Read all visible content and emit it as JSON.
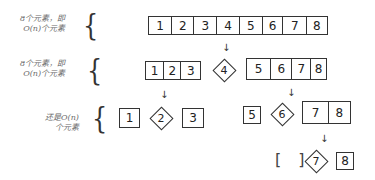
{
  "levels": [
    {
      "label_line1": "8个元素，即",
      "label_line2": "O(n)个元素",
      "groups": [
        {
          "type": "array",
          "values": [
            "1",
            "2",
            "3",
            "4",
            "5",
            "6",
            "7",
            "8"
          ]
        }
      ]
    },
    {
      "label_line1": "8个元素，即",
      "label_line2": "O(n)个元素",
      "groups": [
        {
          "type": "array",
          "values": [
            "1",
            "2",
            "3"
          ]
        },
        {
          "type": "pivot",
          "value": "4"
        },
        {
          "type": "array",
          "values": [
            "5",
            "6",
            "7",
            "8"
          ]
        }
      ]
    },
    {
      "label_line1": "还是O(n)",
      "label_line2": "个元素",
      "groups": [
        {
          "type": "array",
          "values": [
            "1"
          ]
        },
        {
          "type": "pivot",
          "value": "2"
        },
        {
          "type": "array",
          "values": [
            "3"
          ]
        },
        {
          "type": "array",
          "values": [
            "5"
          ]
        },
        {
          "type": "pivot",
          "value": "6"
        },
        {
          "type": "array",
          "values": [
            "7",
            "8"
          ]
        }
      ]
    },
    {
      "groups": [
        {
          "type": "empty",
          "value": "[ ]"
        },
        {
          "type": "pivot",
          "value": "7"
        },
        {
          "type": "array",
          "values": [
            "8"
          ]
        }
      ]
    }
  ],
  "arrow_glyph": "↓",
  "brace_glyph": "{"
}
